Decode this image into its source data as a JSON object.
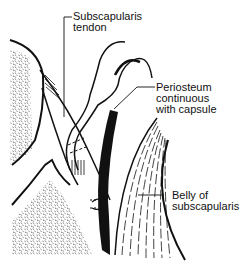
{
  "diagram": {
    "labels": {
      "subscapularis_tendon": {
        "line1": "Subscapularis",
        "line2": "tendon"
      },
      "periosteum": {
        "line1": "Periosteum",
        "line2": "continuous",
        "line3": "with capsule"
      },
      "belly": {
        "line1": "Belly of",
        "line2": "subscapularis"
      }
    },
    "colors": {
      "ink": "#111111",
      "background": "#ffffff"
    }
  }
}
